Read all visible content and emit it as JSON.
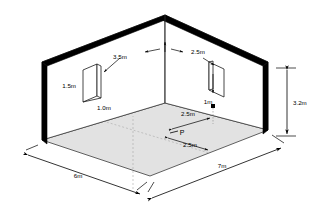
{
  "drawing": {
    "title": "Isometric room with two windows and point P",
    "view": "isometric-cutaway",
    "colors": {
      "wall": "#000000",
      "outline": "#1a1a1a",
      "floor_fill": "#e2e2e2",
      "grid": "#9a9a9a",
      "background": "#ffffff"
    }
  },
  "room": {
    "dimensions": [
      {
        "name": "left-floor-edge",
        "value": "6m"
      },
      {
        "name": "right-floor-edge",
        "value": "7m"
      },
      {
        "name": "wall-height",
        "value": "3.2m"
      }
    ]
  },
  "windows": [
    {
      "id": "left-window",
      "labels": {
        "offset_from_corner": "3.5m",
        "height": "1.5m",
        "width": "1.0m"
      }
    },
    {
      "id": "right-window",
      "labels": {
        "offset_from_corner": "2.5m",
        "sill_height": "1m"
      }
    }
  ],
  "point": {
    "label": "P",
    "offset_a": "2.5m",
    "offset_b": "2.5m"
  }
}
